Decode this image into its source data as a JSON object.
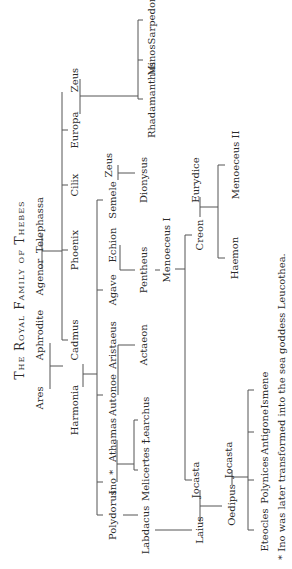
{
  "title": "The Royal Family of Thebes",
  "footnote": "* Ino was later transformed into the sea goddess Leucothea.",
  "people": {
    "ares": "Ares",
    "aphrodite": "Aphrodite",
    "agenor": "Agenor",
    "telephassa": "Telephassa",
    "harmonia": "Harmonia",
    "cadmus": "Cadmus",
    "phoenix": "Phoenix",
    "cilix": "Cilix",
    "europa": "Europa",
    "zeus1": "Zeus",
    "polydorus": "Polydorus",
    "ino": "Ino *",
    "athamas": "Athamas",
    "autonoe": "Autonoe",
    "aristaeus": "Aristaeus",
    "agave": "Agave",
    "echion": "Echion",
    "semele": "Semele",
    "zeus2": "Zeus",
    "labdacus": "Labdacus",
    "melicertes": "Melicertes †",
    "learchus": "Learchus",
    "actaeon": "Actaeon",
    "pentheus": "Pentheus",
    "dionysus": "Dionysus",
    "rhadamanthus": "Rhadamanthus",
    "minos": "Minos",
    "sarpedon": "Sarpedon",
    "menoeceus1": "Menoeceus I",
    "laius": "Laius",
    "jocasta1": "Jocasta",
    "creon": "Creon",
    "eurydice": "Eurydice",
    "oedipus": "Oedipus",
    "jocasta2": "Jocasta",
    "haemon": "Haemon",
    "menoeceus2": "Menoeceus II",
    "eteocles": "Eteocles",
    "polynices": "Polynices",
    "antigone": "Antigone",
    "ismene": "Ismene"
  }
}
